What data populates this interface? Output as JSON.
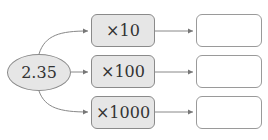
{
  "start": {
    "value": "2.35"
  },
  "operations": [
    {
      "label": "×10"
    },
    {
      "label": "×100"
    },
    {
      "label": "×1000"
    }
  ],
  "results": [
    {
      "value": ""
    },
    {
      "value": ""
    },
    {
      "value": ""
    }
  ],
  "colors": {
    "box_fill": "#e6e6e6",
    "stroke": "#8a8a8a",
    "arrow": "#777777"
  }
}
